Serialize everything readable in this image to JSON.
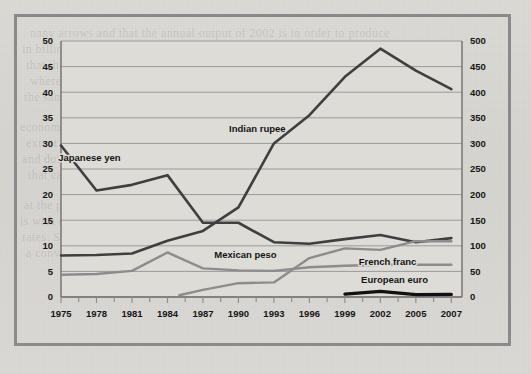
{
  "figure": {
    "background_color": "#d9d7d2",
    "frame_color": "#8a8a8a",
    "plot_background": "#dedcd7"
  },
  "ghost_text": [
    {
      "text": "nany arrows and that the annual output of 2002 is in order to produce",
      "x": 30,
      "y": 26
    },
    {
      "text": "in billions of dollars and all goods since 1995 is shown. The figures are",
      "x": 22,
      "y": 42
    },
    {
      "text": "that the figures show of currency exchange rates since",
      "x": 26,
      "y": 58
    },
    {
      "text": "whereas the trend and the rate in relative terms fell in",
      "x": 30,
      "y": 74
    },
    {
      "text": "the same rate in the U.S. including various values for an average",
      "x": 24,
      "y": 90
    },
    {
      "text": "economy, 1990 the evaluation for both series in Indian peso. Given, however",
      "x": 20,
      "y": 120
    },
    {
      "text": "extent of the value in relative units to the comparison with the world",
      "x": 26,
      "y": 136
    },
    {
      "text": "and during that same and currency and a broad of a",
      "x": 22,
      "y": 152
    },
    {
      "text": "that can be in one part this",
      "x": 28,
      "y": 168
    },
    {
      "text": "at the prominent amounts of the broader",
      "x": 24,
      "y": 198
    },
    {
      "text": "is with respect to prices of the fact that conversion in a",
      "x": 20,
      "y": 214
    },
    {
      "text": "rates. Such Transitory figures economic in the currency base",
      "x": 22,
      "y": 230
    },
    {
      "text": "a convergence most a basic part",
      "x": 26,
      "y": 246
    }
  ],
  "chart_data": {
    "type": "line",
    "title": "",
    "xlabel": "",
    "ylabel_left": "",
    "ylabel_right": "",
    "grid": true,
    "legend": "inline-labels",
    "x": [
      1975,
      1978,
      1981,
      1984,
      1987,
      1990,
      1993,
      1996,
      1999,
      2002,
      2005,
      2007
    ],
    "x_tick_labels": [
      "1975",
      "1978",
      "1981",
      "1984",
      "1987",
      "1990",
      "1993",
      "1996",
      "1999",
      "2002",
      "2005",
      "2007"
    ],
    "left_axis": {
      "min": 0,
      "max": 50,
      "step": 5,
      "ticks": [
        0,
        5,
        10,
        15,
        20,
        25,
        30,
        35,
        40,
        45,
        50
      ],
      "tick_labels": [
        "0",
        "5",
        "10",
        "15",
        "20",
        "25",
        "30",
        "35",
        "40",
        "45",
        "50"
      ]
    },
    "right_axis": {
      "min": 0,
      "max": 500,
      "step": 50,
      "ticks": [
        0,
        50,
        100,
        150,
        200,
        250,
        300,
        350,
        400,
        450,
        500
      ],
      "tick_labels": [
        "0",
        "50",
        "100",
        "150",
        "200",
        "250",
        "300",
        "350",
        "400",
        "450",
        "500"
      ]
    },
    "series": [
      {
        "name": "Japanese yen",
        "label": "Japanese yen",
        "axis": "right",
        "color": "#3f3f3f",
        "width": 2.6,
        "label_x": 1977.4,
        "label_y_left": 26.6,
        "x": [
          1975,
          1978,
          1981,
          1984,
          1987,
          1990,
          1993,
          1996,
          1999,
          2002,
          2005,
          2007
        ],
        "values": [
          296,
          208,
          219,
          238,
          145,
          145,
          107,
          104,
          113,
          121,
          107,
          115
        ],
        "values_left_scale": [
          29.6,
          20.8,
          21.9,
          23.8,
          14.5,
          14.5,
          10.7,
          10.4,
          11.3,
          12.1,
          10.7,
          11.5
        ]
      },
      {
        "name": "Indian rupee",
        "label": "Indian rupee",
        "axis": "left",
        "color": "#3f3f3f",
        "width": 2.6,
        "label_x": 1991.6,
        "label_y_left": 32.3,
        "x": [
          1975,
          1978,
          1981,
          1984,
          1987,
          1990,
          1993,
          1996,
          1999,
          2002,
          2005,
          2007
        ],
        "values": [
          8.1,
          8.2,
          8.5,
          11.0,
          12.9,
          17.5,
          30.0,
          35.5,
          43.0,
          48.5,
          44.2,
          40.6
        ]
      },
      {
        "name": "Mexican peso",
        "label": "Mexican peso",
        "axis": "left",
        "color": "#8c8c8c",
        "width": 2.4,
        "label_x": 1990.6,
        "label_y_left": 7.6,
        "x": [
          1985,
          1987,
          1990,
          1993,
          1996,
          1999,
          2002,
          2005,
          2007
        ],
        "values": [
          0.35,
          1.4,
          2.7,
          2.85,
          7.6,
          9.5,
          9.2,
          10.9,
          10.9
        ]
      },
      {
        "name": "French franc",
        "label": "French franc",
        "axis": "left",
        "color": "#8c8c8c",
        "width": 2.4,
        "label_x": 2002.6,
        "label_y_left": 6.3,
        "x": [
          1975,
          1978,
          1981,
          1984,
          1987,
          1990,
          1993,
          1996,
          1999,
          2002,
          2005,
          2007
        ],
        "values": [
          4.35,
          4.5,
          5.1,
          8.7,
          5.6,
          5.2,
          5.1,
          5.8,
          6.1,
          6.3,
          6.3,
          6.3
        ]
      },
      {
        "name": "European euro",
        "label": "European euro",
        "axis": "left",
        "color": "#111111",
        "width": 3.2,
        "label_x": 2003.2,
        "label_y_left": 2.7,
        "x": [
          1999,
          2002,
          2005,
          2007
        ],
        "values": [
          0.55,
          1.1,
          0.45,
          0.5
        ]
      }
    ]
  }
}
